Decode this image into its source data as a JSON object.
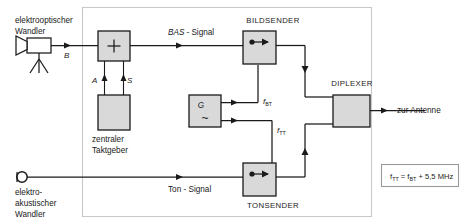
{
  "diagram": {
    "colors": {
      "block_fill": "#d9d9d9",
      "line": "#1a1a1a",
      "frame": "#c9c9c9"
    },
    "sources": {
      "camera": {
        "name": "elektrooptischer-wandler",
        "label_line1": "elektrooptischer",
        "label_line2": "Wandler",
        "output_signal": "B",
        "icon": "video-camera-tripod-icon"
      },
      "microphone": {
        "name": "elektroakustischer-wandler",
        "label_line1": "elektro-",
        "label_line2": "akustischer",
        "label_line3": "Wandler",
        "icon": "microphone-icon"
      }
    },
    "blocks": [
      {
        "id": "adder",
        "name": "adder-block",
        "symbol": "+",
        "label": "",
        "icon": "plus-icon"
      },
      {
        "id": "clock",
        "name": "zentraler-taktgeber-block",
        "symbol": "",
        "label_line1": "zentraler",
        "label_line2": "Taktgeber",
        "icon": "clock-generator-icon"
      },
      {
        "id": "generator",
        "name": "generator-block",
        "symbol": "G",
        "wave": "~",
        "label": "",
        "icon": "oscillator-icon"
      },
      {
        "id": "bildsender",
        "name": "bildsender-block",
        "label": "BILDSENDER",
        "icon": "transmitter-icon"
      },
      {
        "id": "tonsender",
        "name": "tonsender-block",
        "label": "TONSENDER",
        "icon": "transmitter-icon"
      },
      {
        "id": "diplexer",
        "name": "diplexer-block",
        "label": "DIPLEXER",
        "icon": "diplexer-icon"
      }
    ],
    "signal_labels": {
      "b": "B",
      "a": "A",
      "s": "S",
      "bas_italic": "BAS",
      "bas_rest": "- Signal",
      "ton": "Ton - Signal",
      "f_bt_base": "f",
      "f_bt_sub": "BT",
      "f_tt_base": "f",
      "f_tt_sub": "TT"
    },
    "output": {
      "name": "antenna-output-label",
      "label": "zur Antenne"
    },
    "formula": {
      "name": "frequency-formula",
      "base1": "f",
      "sub1": "TT",
      "mid": " = f",
      "sub2": "BT",
      "tail": " + 5,5 MHz"
    }
  }
}
